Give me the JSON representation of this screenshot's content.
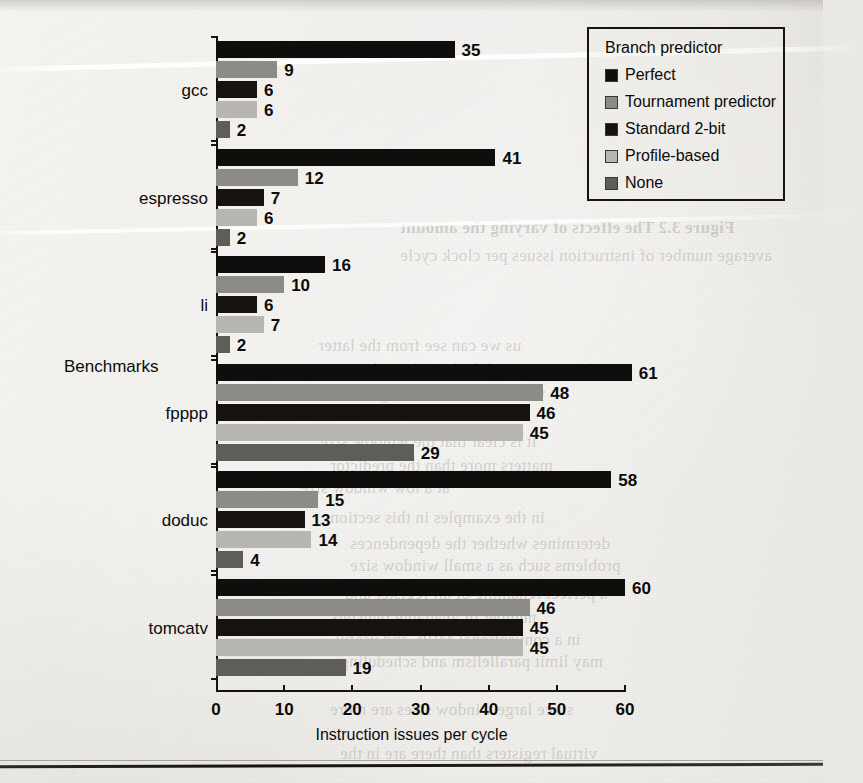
{
  "chart_data": {
    "type": "bar",
    "orientation": "horizontal",
    "title": "",
    "xlabel": "Instruction issues per cycle",
    "ylabel": "Benchmarks",
    "xlim": [
      0,
      60
    ],
    "xticks": [
      0,
      10,
      20,
      30,
      40,
      50,
      60
    ],
    "grid": false,
    "legend_position": "top-right",
    "legend_title": "Branch predictor",
    "categories": [
      "gcc",
      "espresso",
      "li",
      "fpppp",
      "doduc",
      "tomcatv"
    ],
    "series": [
      {
        "name": "Perfect",
        "color": "#100e0c",
        "values": [
          35,
          41,
          16,
          61,
          58,
          60
        ]
      },
      {
        "name": "Tournament predictor",
        "color": "#8d8b86",
        "values": [
          9,
          12,
          10,
          48,
          15,
          46
        ]
      },
      {
        "name": "Standard 2-bit",
        "color": "#15120f",
        "values": [
          6,
          7,
          6,
          46,
          13,
          45
        ]
      },
      {
        "name": "Profile-based",
        "color": "#b8b6b0",
        "values": [
          6,
          6,
          7,
          45,
          14,
          45
        ]
      },
      {
        "name": "None",
        "color": "#5f5d58",
        "values": [
          2,
          2,
          2,
          29,
          4,
          19
        ]
      }
    ]
  },
  "legend": {
    "title": "Branch predictor",
    "items": [
      {
        "label": "Perfect",
        "swatch": "#100e0c"
      },
      {
        "label": "Tournament predictor",
        "swatch": "#8d8b86"
      },
      {
        "label": "Standard 2-bit",
        "swatch": "#15120f"
      },
      {
        "label": "Profile-based",
        "swatch": "#b8b6b0"
      },
      {
        "label": "None",
        "swatch": "#5f5d58"
      }
    ]
  },
  "axes": {
    "x_label": "Instruction issues per cycle",
    "y_label": "Benchmarks",
    "x_tick_labels": [
      "0",
      "10",
      "20",
      "30",
      "40",
      "50",
      "60"
    ]
  },
  "background_text": [
    {
      "text": "Figure 3.2  The effects of varying the amount",
      "x": 400,
      "y": 218,
      "size": 17,
      "bold": true,
      "mirrored": true
    },
    {
      "text": "average number of instruction issues per clock cycle",
      "x": 400,
      "y": 246,
      "size": 17,
      "bold": false,
      "mirrored": true
    },
    {
      "text": "us we can see from the latter",
      "x": 318,
      "y": 336,
      "size": 17,
      "bold": false,
      "mirrored": true
    },
    {
      "text": "the miss rate of the branch predictor",
      "x": 340,
      "y": 360,
      "size": 17,
      "bold": false,
      "mirrored": true
    },
    {
      "text": "which are shown in Figure 3.3",
      "x": 330,
      "y": 384,
      "size": 17,
      "bold": false,
      "mirrored": true
    },
    {
      "text": "it is clear that the window size",
      "x": 320,
      "y": 432,
      "size": 17,
      "bold": false,
      "mirrored": true
    },
    {
      "text": "matters more than the predictor",
      "x": 330,
      "y": 456,
      "size": 17,
      "bold": false,
      "mirrored": true
    },
    {
      "text": "at a low window size",
      "x": 300,
      "y": 478,
      "size": 17,
      "bold": false,
      "mirrored": true
    },
    {
      "text": "in the examples in this section",
      "x": 330,
      "y": 508,
      "size": 17,
      "bold": false,
      "mirrored": true
    },
    {
      "text": "determines whether the dependences",
      "x": 350,
      "y": 534,
      "size": 17,
      "bold": false,
      "mirrored": true
    },
    {
      "text": "problems such as a small window size",
      "x": 350,
      "y": 556,
      "size": 17,
      "bold": false,
      "mirrored": true
    },
    {
      "text": "a perfect renaming of all register and",
      "x": 345,
      "y": 584,
      "size": 17,
      "bold": false,
      "mirrored": true
    },
    {
      "text": "number of available registers",
      "x": 330,
      "y": 608,
      "size": 17,
      "bold": false,
      "mirrored": true
    },
    {
      "text": "in a conventional MIPS and useful",
      "x": 335,
      "y": 630,
      "size": 17,
      "bold": false,
      "mirrored": true
    },
    {
      "text": "may limit parallelism and scheduling",
      "x": 340,
      "y": 652,
      "size": 17,
      "bold": false,
      "mirrored": true
    },
    {
      "text": "since large window sizes are more",
      "x": 330,
      "y": 700,
      "size": 17,
      "bold": false,
      "mirrored": true
    },
    {
      "text": "virtual registers than there are in the",
      "x": 340,
      "y": 744,
      "size": 17,
      "bold": false,
      "mirrored": true
    }
  ]
}
